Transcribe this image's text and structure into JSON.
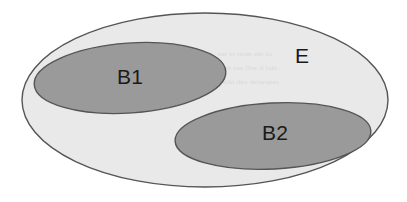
{
  "figure": {
    "type": "venn-diagram",
    "caption": "",
    "background_color": "#ffffff",
    "width": 407,
    "height": 202
  },
  "colors": {
    "universe_fill": "#e9e9e9",
    "subset_fill": "#9a9a9a",
    "stroke": "#555555",
    "label_text": "#1a1a1a",
    "background": "#ffffff",
    "ghost_text": "#d2d2d2"
  },
  "sets": [
    {
      "id": "universe",
      "label": "E",
      "role": "universal-set",
      "fill": "#e9e9e9",
      "stroke": "#555555",
      "cx": 205,
      "cy": 100,
      "rx": 183,
      "ry": 87,
      "rotation": 0,
      "label_x": 302,
      "label_y": 57
    },
    {
      "id": "b1",
      "label": "B1",
      "role": "subset",
      "fill": "#9a9a9a",
      "stroke": "#555555",
      "cx": 130,
      "cy": 78,
      "rx": 96,
      "ry": 35,
      "rotation": -4,
      "label_x": 130,
      "label_y": 78
    },
    {
      "id": "b2",
      "label": "B2",
      "role": "subset",
      "fill": "#9a9a9a",
      "stroke": "#555555",
      "cx": 273,
      "cy": 136,
      "rx": 98,
      "ry": 33,
      "rotation": -3,
      "label_x": 275,
      "label_y": 134
    }
  ],
  "relations": {
    "b1_in_e": true,
    "b2_in_e": true,
    "b1_intersect_b2": false
  },
  "artifacts": {
    "bleed_through_lines": [
      "sut ot tsom eht fo",
      "eb ton lliw ti taht",
      "si siht dna detarapes"
    ]
  }
}
